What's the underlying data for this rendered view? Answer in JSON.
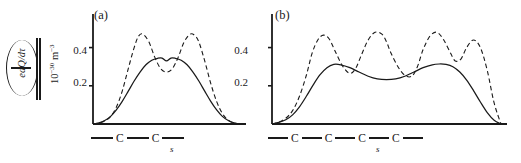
{
  "figure": {
    "y_axis_label": {
      "numerator": "dQ/dτ",
      "denominator": "e",
      "units_mantissa": "10",
      "units_exp": "−30",
      "units_symbol": "m",
      "units_symbol_exp": "−3"
    }
  },
  "chart_data": [
    {
      "id": "panel-a",
      "type": "line",
      "title": "(a)",
      "xlabel": "s",
      "ylabel": "(dQ/dτ)/e  /  10⁻³⁰ m⁻³",
      "xlim": [
        0,
        1
      ],
      "ylim": [
        0,
        0.56
      ],
      "yticks": [
        0.2,
        0.4
      ],
      "ytick_labels": [
        "0.2",
        "0.4"
      ],
      "xticks": [],
      "grid": false,
      "legend": "none",
      "chain_annotation": [
        "—",
        "C",
        "—",
        "C",
        "—"
      ],
      "chain_axis_symbol": "s",
      "series": [
        {
          "name": "solid",
          "style": "solid",
          "x": [
            0.0,
            0.04,
            0.08,
            0.12,
            0.16,
            0.2,
            0.24,
            0.28,
            0.32,
            0.36,
            0.4,
            0.44,
            0.47,
            0.5,
            0.53,
            0.56,
            0.6,
            0.64,
            0.68,
            0.72,
            0.76,
            0.8,
            0.84,
            0.88,
            0.92,
            0.96,
            1.0
          ],
          "values": [
            0.0,
            0.006,
            0.018,
            0.04,
            0.075,
            0.12,
            0.172,
            0.225,
            0.272,
            0.31,
            0.334,
            0.344,
            0.345,
            0.33,
            0.345,
            0.344,
            0.334,
            0.31,
            0.272,
            0.225,
            0.172,
            0.12,
            0.075,
            0.04,
            0.018,
            0.006,
            0.0
          ]
        },
        {
          "name": "dashed",
          "style": "dashed",
          "x": [
            0.0,
            0.04,
            0.08,
            0.12,
            0.16,
            0.2,
            0.24,
            0.28,
            0.31,
            0.34,
            0.38,
            0.42,
            0.46,
            0.5,
            0.54,
            0.58,
            0.62,
            0.66,
            0.69,
            0.72,
            0.76,
            0.8,
            0.84,
            0.88,
            0.92,
            0.96,
            1.0
          ],
          "values": [
            0.0,
            0.005,
            0.016,
            0.04,
            0.09,
            0.175,
            0.29,
            0.4,
            0.46,
            0.47,
            0.43,
            0.35,
            0.29,
            0.272,
            0.29,
            0.35,
            0.43,
            0.47,
            0.465,
            0.43,
            0.33,
            0.215,
            0.12,
            0.055,
            0.02,
            0.005,
            0.0
          ]
        }
      ]
    },
    {
      "id": "panel-b",
      "type": "line",
      "title": "(b)",
      "xlabel": "s",
      "ylabel": "(dQ/dτ)/e  /  10⁻³⁰ m⁻³",
      "xlim": [
        0,
        1
      ],
      "ylim": [
        0,
        0.56
      ],
      "yticks": [
        0.2,
        0.4
      ],
      "ytick_labels": [
        "0.2",
        "0.4"
      ],
      "xticks": [],
      "grid": false,
      "legend": "none",
      "chain_annotation": [
        "—",
        "C",
        "—",
        "C",
        "—",
        "C",
        "—",
        "C",
        "—"
      ],
      "chain_axis_symbol": "s",
      "series": [
        {
          "name": "solid",
          "style": "solid",
          "x": [
            0.0,
            0.03,
            0.06,
            0.09,
            0.12,
            0.15,
            0.18,
            0.21,
            0.24,
            0.27,
            0.3,
            0.34,
            0.38,
            0.42,
            0.46,
            0.5,
            0.54,
            0.58,
            0.62,
            0.66,
            0.7,
            0.73,
            0.76,
            0.79,
            0.82,
            0.85,
            0.88,
            0.91,
            0.94,
            0.97,
            1.0
          ],
          "values": [
            0.0,
            0.008,
            0.022,
            0.048,
            0.09,
            0.145,
            0.205,
            0.258,
            0.295,
            0.312,
            0.31,
            0.295,
            0.272,
            0.25,
            0.236,
            0.232,
            0.236,
            0.25,
            0.272,
            0.295,
            0.31,
            0.314,
            0.312,
            0.3,
            0.272,
            0.23,
            0.175,
            0.115,
            0.06,
            0.02,
            0.0
          ]
        },
        {
          "name": "dashed",
          "style": "dashed",
          "x": [
            0.0,
            0.03,
            0.06,
            0.09,
            0.12,
            0.15,
            0.175,
            0.2,
            0.225,
            0.25,
            0.28,
            0.31,
            0.34,
            0.365,
            0.39,
            0.42,
            0.45,
            0.48,
            0.5,
            0.52,
            0.55,
            0.58,
            0.61,
            0.635,
            0.66,
            0.69,
            0.72,
            0.75,
            0.78,
            0.8,
            0.825,
            0.85,
            0.88,
            0.91,
            0.94,
            0.97,
            1.0
          ],
          "values": [
            0.0,
            0.01,
            0.03,
            0.07,
            0.145,
            0.255,
            0.37,
            0.44,
            0.465,
            0.445,
            0.37,
            0.3,
            0.265,
            0.29,
            0.36,
            0.44,
            0.48,
            0.47,
            0.43,
            0.37,
            0.3,
            0.255,
            0.25,
            0.3,
            0.39,
            0.46,
            0.48,
            0.44,
            0.37,
            0.33,
            0.34,
            0.4,
            0.44,
            0.4,
            0.28,
            0.11,
            0.0
          ]
        }
      ]
    }
  ]
}
